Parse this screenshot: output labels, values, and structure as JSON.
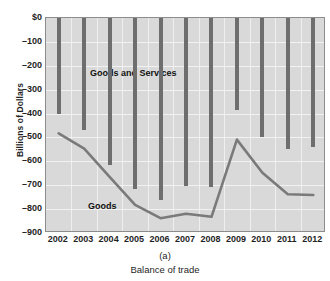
{
  "chart_data": {
    "type": "bar",
    "title": "",
    "xlabel": "Balance of trade",
    "ylabel": "Billions of Dollars",
    "panel_label": "(a)",
    "categories": [
      "2002",
      "2003",
      "2004",
      "2005",
      "2006",
      "2007",
      "2008",
      "2009",
      "2010",
      "2011",
      "2012"
    ],
    "ylim": [
      -900,
      0
    ],
    "yticks": [
      0,
      -100,
      -200,
      -300,
      -400,
      -500,
      -600,
      -700,
      -800,
      -900
    ],
    "ytick_labels": [
      "$0",
      "–100",
      "–200",
      "–300",
      "–400",
      "–500",
      "–600",
      "–700",
      "–800",
      "–900"
    ],
    "grid": true,
    "legend_position": "inline-annotations",
    "series": [
      {
        "name": "Goods and Services",
        "render": "bar",
        "color": "#6e6e6e",
        "annotation": "Goods and Services",
        "values": [
          -403,
          -467,
          -615,
          -714,
          -762,
          -705,
          -709,
          -384,
          -500,
          -550,
          -540
        ]
      },
      {
        "name": "Goods",
        "render": "line",
        "color": "#7a7a7a",
        "annotation": "Goods",
        "values": [
          -483,
          -547,
          -665,
          -782,
          -838,
          -819,
          -832,
          -509,
          -648,
          -738,
          -741
        ]
      }
    ]
  },
  "axes": {
    "y_title": "Billions of Dollars",
    "x_caption": "(a)",
    "x_title": "Balance of trade"
  },
  "annotations": {
    "goods_and_services": "Goods and Services",
    "goods": "Goods"
  }
}
